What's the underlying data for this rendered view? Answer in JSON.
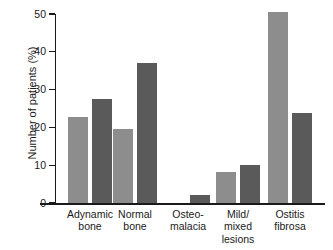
{
  "chart_data": {
    "type": "bar",
    "title": "",
    "xlabel": "",
    "ylabel": "Number of patients (%)",
    "ylim": [
      0,
      50
    ],
    "yticks": [
      0,
      10,
      20,
      30,
      40,
      50
    ],
    "ytick_labels": [
      "0",
      "10",
      "20",
      "30",
      "40",
      "50"
    ],
    "grid": false,
    "legend": "none",
    "categories": [
      "Adynamic\nbone",
      "Normal\nbone",
      "Osteo-\nmalacia",
      "Mild/\nmixed\nlesions",
      "Ostitis\nfibrosa"
    ],
    "series": [
      {
        "name": "series-1",
        "color": "#8d8d8d",
        "values": [
          22.8,
          19.6,
          0,
          8.2,
          50.5
        ]
      },
      {
        "name": "series-2",
        "color": "#5a5a5a",
        "values": [
          27.4,
          37.0,
          2.0,
          10.0,
          23.8
        ]
      }
    ]
  },
  "axis": {
    "y_title": "Number of patients (%)"
  },
  "colors": {
    "series_light": "#8d8d8d",
    "series_dark": "#5a5a5a",
    "axis": "#1a1a1a",
    "background": "#ffffff"
  }
}
